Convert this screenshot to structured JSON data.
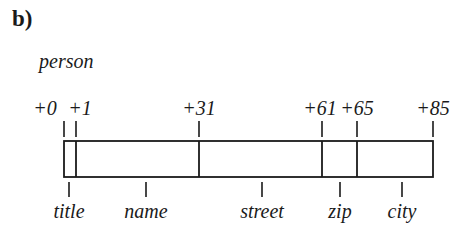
{
  "panel_label": "b)",
  "struct": {
    "name": "person",
    "total_size": 85
  },
  "offsets": [
    {
      "label": "+0",
      "value": 0
    },
    {
      "label": "+1",
      "value": 1
    },
    {
      "label": "+31",
      "value": 31
    },
    {
      "label": "+61",
      "value": 61
    },
    {
      "label": "+65",
      "value": 65
    },
    {
      "label": "+85",
      "value": 85
    }
  ],
  "fields": [
    {
      "name": "title",
      "start": 0,
      "end": 1
    },
    {
      "name": "name",
      "start": 1,
      "end": 31
    },
    {
      "name": "street",
      "start": 31,
      "end": 61
    },
    {
      "name": "zip",
      "start": 61,
      "end": 65
    },
    {
      "name": "city",
      "start": 65,
      "end": 85
    }
  ],
  "colors": {
    "stroke": "#1a1a1a",
    "background": "#ffffff"
  }
}
